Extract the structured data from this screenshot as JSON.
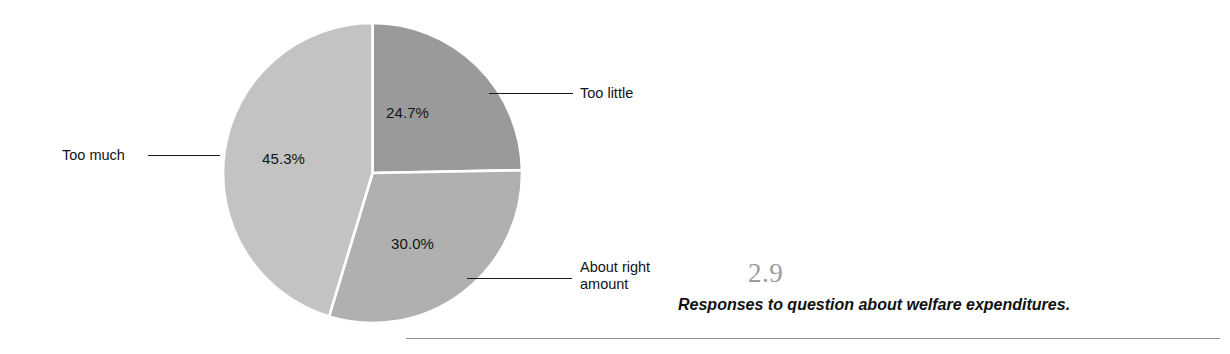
{
  "chart_data": {
    "type": "pie",
    "title": "",
    "categories": [
      "Too little",
      "About right amount",
      "Too much"
    ],
    "values": [
      24.7,
      30.0,
      45.3
    ],
    "value_labels": [
      "24.7%",
      "30.0%",
      "45.3%"
    ],
    "units": "percent",
    "start_angle_deg": 0,
    "direction": "clockwise",
    "legend": "none",
    "grid": false,
    "slice_colors": [
      "#9a9a9a",
      "#b0b0b0",
      "#c3c3c3"
    ],
    "slice_border_color": "#ffffff",
    "slices": [
      {
        "label": "Too little",
        "value": 24.7,
        "value_label": "24.7%",
        "color": "#9a9a9a",
        "angle_deg": 88.9
      },
      {
        "label": "About right amount",
        "value": 30.0,
        "value_label": "30.0%",
        "color": "#b0b0b0",
        "angle_deg": 108.0
      },
      {
        "label": "Too much",
        "value": 45.3,
        "value_label": "45.3%",
        "color": "#c3c3c3",
        "angle_deg": 163.1
      }
    ]
  },
  "callouts": {
    "too_little": "Too little",
    "about_right_line1": "About right",
    "about_right_line2": "amount",
    "too_much": "Too much"
  },
  "caption": {
    "figure_number": "2.9",
    "text": "Responses to question about welfare expenditures."
  }
}
